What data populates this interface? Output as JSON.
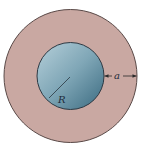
{
  "diagram": {
    "labels": {
      "inner_radius": "R",
      "shell_thickness": "a"
    },
    "colors": {
      "background": "#ffffff",
      "shell_fill": "#c9a8a2",
      "shell_outline": "#5a4a48",
      "core_fill_light": "#a9c6d2",
      "core_fill_dark": "#3f6f84",
      "core_outline": "#2e3a44",
      "line": "#2a2a2a"
    }
  }
}
